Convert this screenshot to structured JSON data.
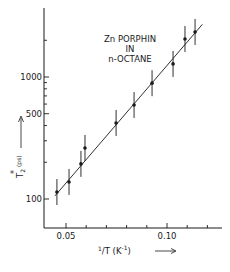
{
  "chart_data": {
    "type": "scatter",
    "title": "",
    "annotation": [
      "Zn PORPHIN",
      "IN",
      "n-OCTANE"
    ],
    "xlabel": "1/T  (K⁻¹)",
    "ylabel": "T₂* (ps)",
    "x_scale": "linear",
    "y_scale": "log",
    "xlim": [
      0.039,
      0.125
    ],
    "ylim": [
      50,
      3000
    ],
    "x_ticks": [
      0.05,
      0.06,
      0.07,
      0.08,
      0.09,
      0.1,
      0.11,
      0.12
    ],
    "x_tick_labels": [
      "0.05",
      "0.10"
    ],
    "y_ticks": [
      100,
      200,
      300,
      400,
      500,
      600,
      700,
      800,
      900,
      1000,
      2000
    ],
    "y_tick_labels": [
      "100",
      "500",
      "1000"
    ],
    "grid": false,
    "legend": null,
    "series": [
      {
        "name": "data",
        "marker": "filled-circle",
        "error_bars": true,
        "x": [
          0.0455,
          0.0515,
          0.0574,
          0.0594,
          0.0748,
          0.0837,
          0.0926,
          0.103,
          0.1089,
          0.1139
        ],
        "y": [
          114,
          138,
          194,
          262,
          420,
          590,
          890,
          1280,
          2050,
          2340
        ]
      },
      {
        "name": "fit",
        "style": "line",
        "x": [
          0.0455,
          0.1175
        ],
        "y": [
          110,
          2700
        ]
      }
    ],
    "colors": {
      "ink": "#1a1a1a",
      "background": "#ffffff"
    }
  }
}
